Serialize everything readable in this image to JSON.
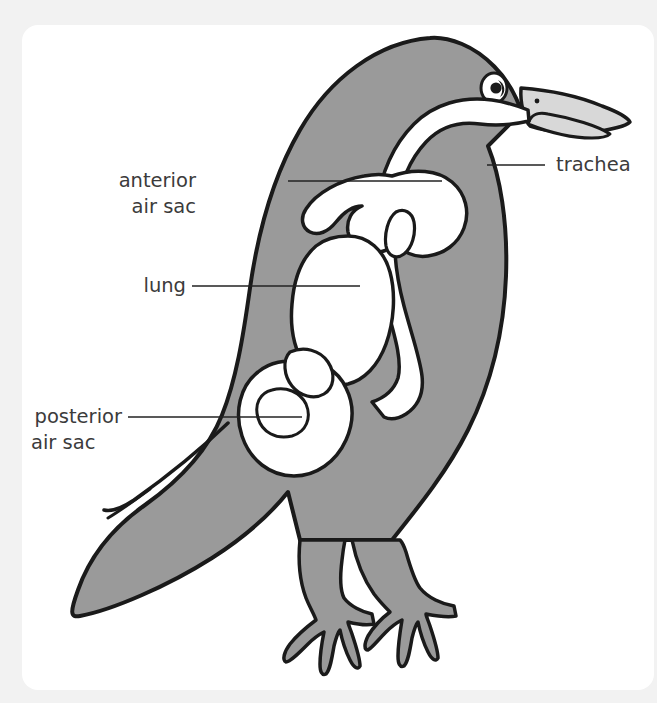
{
  "figure": {
    "title_partial_cut_off_top": "",
    "background_color": "#f2f2f2",
    "card_color": "#ffffff",
    "body_fill_color": "#9a9a9a",
    "organ_fill_color": "#ffffff",
    "outline_color": "#1a1a1a",
    "beak_fill_color": "#d8d8d8",
    "label_text_color": "#3b3b3b",
    "leader_line_color": "#222222"
  },
  "labels": [
    {
      "id": "anterior-air-sac",
      "line1": "anterior",
      "line2": "air sac",
      "x": 196,
      "y1": 187,
      "y2": 213,
      "leader": {
        "x1": 288,
        "y1": 181,
        "x2": 442,
        "y2": 181
      }
    },
    {
      "id": "lung",
      "line1": "lung",
      "line2": "",
      "x": 139,
      "y1": 292,
      "y2": 292,
      "leader": {
        "x1": 192,
        "y1": 286,
        "x2": 360,
        "y2": 286
      }
    },
    {
      "id": "posterior-air-sac",
      "line1": "posterior",
      "line2": "air sac",
      "x": 31,
      "y1": 423,
      "y2": 449,
      "leader": {
        "x1": 128,
        "y1": 417,
        "x2": 302,
        "y2": 417
      }
    },
    {
      "id": "trachea",
      "line1": "trachea",
      "line2": "",
      "x": 556,
      "y1": 171,
      "y2": 171,
      "leader": {
        "x1": 487,
        "y1": 165,
        "x2": 545,
        "y2": 165
      }
    }
  ],
  "anatomy_parts": [
    {
      "name": "body",
      "kind": "silhouette"
    },
    {
      "name": "head",
      "kind": "silhouette"
    },
    {
      "name": "beak",
      "kind": "silhouette"
    },
    {
      "name": "eye",
      "kind": "detail"
    },
    {
      "name": "tail",
      "kind": "silhouette"
    },
    {
      "name": "wing",
      "kind": "detail"
    },
    {
      "name": "leg-left",
      "kind": "silhouette"
    },
    {
      "name": "leg-right",
      "kind": "silhouette"
    },
    {
      "name": "trachea",
      "kind": "organ"
    },
    {
      "name": "anterior-air-sac",
      "kind": "organ"
    },
    {
      "name": "lung",
      "kind": "organ"
    },
    {
      "name": "posterior-air-sac",
      "kind": "organ"
    }
  ]
}
